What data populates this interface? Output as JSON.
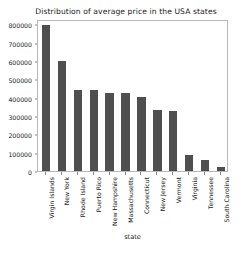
{
  "chart_data": {
    "type": "bar",
    "title": "Distribution of average price in the USA states",
    "xlabel": "state",
    "ylabel": "",
    "categories": [
      "Virgin Islands",
      "New York",
      "Rhode Island",
      "Puerto Rico",
      "New Hampshire",
      "Massachusetts",
      "Connecticut",
      "New Jersey",
      "Vermont",
      "Virginia",
      "Tennessee",
      "South Carolina"
    ],
    "values": [
      795000,
      600000,
      445000,
      440000,
      425000,
      425000,
      405000,
      335000,
      325000,
      90000,
      60000,
      20000
    ],
    "ylim": [
      0,
      830000
    ],
    "yticks": [
      0,
      100000,
      200000,
      300000,
      400000,
      500000,
      600000,
      700000,
      800000
    ],
    "ytick_labels": [
      "0",
      "100000",
      "200000",
      "300000",
      "400000",
      "500000",
      "600000",
      "700000",
      "800000"
    ],
    "grid": false,
    "legend": null,
    "bar_color": "#4f4f4f",
    "frame_color": "#b8b8b8",
    "text_color": "#1a1a1a"
  }
}
